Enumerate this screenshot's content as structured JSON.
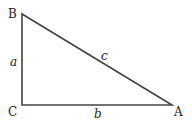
{
  "diagram": {
    "type": "right-triangle",
    "vertices": {
      "B": {
        "label": "B",
        "x": 22,
        "y": 14
      },
      "C": {
        "label": "C",
        "x": 22,
        "y": 105
      },
      "A": {
        "label": "A",
        "x": 172,
        "y": 105
      }
    },
    "sides": {
      "a": {
        "label": "a",
        "from": "B",
        "to": "C"
      },
      "b": {
        "label": "b",
        "from": "C",
        "to": "A"
      },
      "c": {
        "label": "c",
        "from": "B",
        "to": "A"
      }
    },
    "stroke_color": "#444444"
  }
}
